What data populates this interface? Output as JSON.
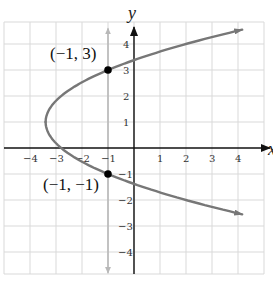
{
  "chart_data": {
    "type": "line",
    "title": "",
    "xlabel": "x",
    "ylabel": "y",
    "xlim": [
      -5,
      5
    ],
    "ylim": [
      -5,
      5
    ],
    "grid": true,
    "x_ticks": [
      -4,
      -3,
      -2,
      -1,
      1,
      2,
      3,
      4
    ],
    "x_tick_labels": [
      "−4",
      "−3",
      "−2",
      "−1",
      "1",
      "2",
      "3",
      "4"
    ],
    "y_ticks": [
      -4,
      -3,
      -2,
      -1,
      1,
      2,
      3,
      4
    ],
    "y_tick_labels": [
      "−4",
      "−3",
      "−2",
      "−1",
      "1",
      "2",
      "3",
      "4"
    ],
    "series": [
      {
        "name": "parabola",
        "description": "Horizontal parabola opening right, vertex approx (-3.4, 1)",
        "equation": "x = 0.6(y - 1)^2 - 3.4",
        "vertex": [
          -3.4,
          1
        ],
        "y_range": [
          -1.95,
          4.45
        ],
        "color": "#777777"
      },
      {
        "name": "vertical-line",
        "description": "Vertical line x = -1 (arrows at both ends)",
        "x": -1,
        "y_range": [
          -4.8,
          4.6
        ],
        "color": "#b8b8b8"
      }
    ],
    "points": [
      {
        "x": -1,
        "y": 3,
        "label": "(−1, 3)"
      },
      {
        "x": -1,
        "y": -1,
        "label": "(−1, −1)"
      }
    ],
    "intercepts": {
      "x_intercept": -2.8,
      "y_intercepts": [
        3.38,
        -1.38
      ]
    }
  }
}
